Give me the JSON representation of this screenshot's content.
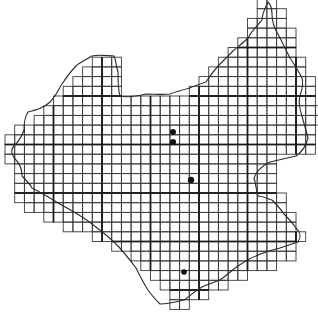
{
  "map": {
    "title": "",
    "grid": {
      "origin_x": 5,
      "origin_y": -1,
      "cell_size": 9.7,
      "line_color": "#3a3a3a",
      "major_line_color": "#1a1a1a",
      "major_every": 5,
      "rows": [
        {
          "r": 0,
          "spans": [
            [
              26,
              27
            ]
          ]
        },
        {
          "r": 1,
          "spans": [
            [
              26,
              28
            ]
          ]
        },
        {
          "r": 2,
          "spans": [
            [
              25,
              28
            ]
          ]
        },
        {
          "r": 3,
          "spans": [
            [
              25,
              29
            ]
          ]
        },
        {
          "r": 4,
          "spans": [
            [
              24,
              29
            ]
          ]
        },
        {
          "r": 5,
          "spans": [
            [
              23,
              29
            ]
          ]
        },
        {
          "r": 6,
          "spans": [
            [
              9,
              11
            ],
            [
              22,
              30
            ]
          ]
        },
        {
          "r": 7,
          "spans": [
            [
              8,
              11
            ],
            [
              21,
              30
            ]
          ]
        },
        {
          "r": 8,
          "spans": [
            [
              7,
              11
            ],
            [
              20,
              31
            ]
          ]
        },
        {
          "r": 9,
          "spans": [
            [
              6,
              11
            ],
            [
              19,
              31
            ]
          ]
        },
        {
          "r": 10,
          "spans": [
            [
              5,
              31
            ]
          ]
        },
        {
          "r": 11,
          "spans": [
            [
              4,
              32
            ]
          ]
        },
        {
          "r": 12,
          "spans": [
            [
              3,
              32
            ]
          ]
        },
        {
          "r": 13,
          "spans": [
            [
              1,
              31
            ]
          ]
        },
        {
          "r": 14,
          "spans": [
            [
              0,
              31
            ]
          ]
        },
        {
          "r": 15,
          "spans": [
            [
              0,
              31
            ]
          ]
        },
        {
          "r": 16,
          "spans": [
            [
              0,
              27
            ]
          ]
        },
        {
          "r": 17,
          "spans": [
            [
              1,
              27
            ]
          ]
        },
        {
          "r": 18,
          "spans": [
            [
              1,
              27
            ]
          ]
        },
        {
          "r": 19,
          "spans": [
            [
              1,
              27
            ]
          ]
        },
        {
          "r": 20,
          "spans": [
            [
              1,
              28
            ]
          ]
        },
        {
          "r": 21,
          "spans": [
            [
              2,
              28
            ]
          ]
        },
        {
          "r": 22,
          "spans": [
            [
              4,
              29
            ]
          ]
        },
        {
          "r": 23,
          "spans": [
            [
              6,
              29
            ]
          ]
        },
        {
          "r": 24,
          "spans": [
            [
              9,
              30
            ]
          ]
        },
        {
          "r": 25,
          "spans": [
            [
              11,
              29
            ]
          ]
        },
        {
          "r": 26,
          "spans": [
            [
              13,
              29
            ]
          ]
        },
        {
          "r": 27,
          "spans": [
            [
              14,
              27
            ]
          ]
        },
        {
          "r": 28,
          "spans": [
            [
              15,
              24
            ]
          ]
        },
        {
          "r": 29,
          "spans": [
            [
              16,
              22
            ]
          ]
        },
        {
          "r": 30,
          "spans": [
            [
              17,
              20
            ]
          ]
        },
        {
          "r": 31,
          "spans": [
            [
              17,
              18
            ]
          ]
        }
      ]
    },
    "boundary_path": "M268,2 C265,8 262,14 262,20 C258,25 252,30 248,38 C242,44 236,48 232,52 C228,56 224,60 220,64 C214,70 210,76 206,82 C200,84 194,86 190,88 C182,90 175,92 170,94 C162,95 154,94 146,94 C138,96 128,98 120,96 C118,90 118,80 118,72 C116,66 116,60 114,56 C108,56 100,54 92,56 C86,60 80,62 76,66 C70,72 66,78 62,84 C58,90 56,96 50,102 C44,108 36,110 28,112 C24,118 24,124 24,130 C22,136 20,140 14,146 C10,150 12,156 16,160 C20,164 22,170 22,176 C26,180 30,184 32,188 C40,192 50,198 60,204 C70,210 82,216 92,224 C100,230 108,236 116,244 C124,252 130,260 136,268 C140,276 144,284 148,290 C152,296 156,300 160,304 C168,304 176,302 184,300 C190,296 196,290 204,286 C210,284 214,282 220,280 C226,276 232,270 238,266 C244,262 250,258 256,256 C264,252 272,250 280,248 C286,246 292,244 298,242 C302,236 300,232 296,228 C292,222 288,218 284,214 C280,208 276,204 272,200 C266,198 262,196 258,196 C256,190 256,184 254,178 C256,172 262,166 270,162 C278,160 288,158 296,156 C302,152 306,146 308,138 C306,130 304,124 302,116 C300,110 298,102 300,96 C302,90 304,84 302,78 C298,70 294,64 290,58 C286,50 282,42 278,34 C274,28 272,22 272,14 C272,8 270,4 268,2 Z",
    "points": [
      {
        "label": "record-1",
        "x": 173,
        "y": 132,
        "r": 3
      },
      {
        "label": "record-2",
        "x": 173,
        "y": 142,
        "r": 3
      },
      {
        "label": "record-3",
        "x": 191,
        "y": 180,
        "r": 3.2
      },
      {
        "label": "record-4",
        "x": 184,
        "y": 272,
        "r": 2.8
      }
    ],
    "dot_color": "#111111"
  }
}
